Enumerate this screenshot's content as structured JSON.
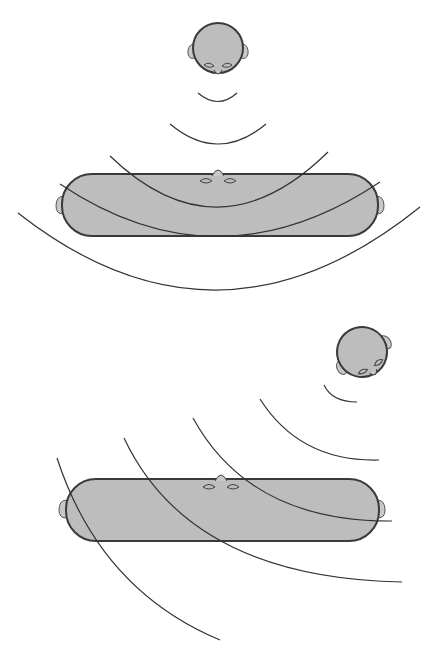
{
  "figure": {
    "colors": {
      "head_fill": "#bdbdbd",
      "outline": "#3a3a3a",
      "wave": "#333333",
      "background": "#ffffff"
    },
    "panels": [
      {
        "name": "top-panel",
        "source_position": "top-center",
        "wave_direction": "downward",
        "wavefront_count": 4,
        "listener": "stretched-head-facing-up"
      },
      {
        "name": "bottom-panel",
        "source_position": "top-right",
        "wave_direction": "diagonal down-left",
        "wavefront_count": 5,
        "listener": "stretched-head-facing-up"
      }
    ],
    "caption": ""
  }
}
